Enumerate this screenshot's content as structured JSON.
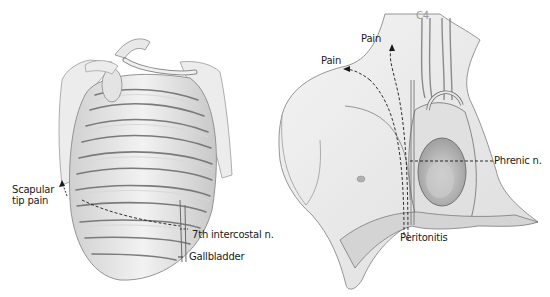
{
  "figure": {
    "left_panel": {
      "subject": "rib-cage-posterior-view",
      "labels": {
        "scapular_line1": "Scapular",
        "scapular_line2": "tip pain",
        "intercostal": "7th intercostal n.",
        "gallbladder": "Gallbladder"
      }
    },
    "right_panel": {
      "subject": "thorax-anterior-view-heart-phrenic-nerve",
      "labels": {
        "c4": "C4",
        "pain_upper": "Pain",
        "pain_left": "Pain",
        "phrenic": "Phrenic n.",
        "peritonitis": "Peritonitis"
      }
    },
    "colors": {
      "background": "#ffffff",
      "ink": "#1a1a1a",
      "shade_light": "#e6e6e6",
      "shade_mid": "#c4c4c4",
      "shade_dark": "#8a8a8a"
    }
  }
}
